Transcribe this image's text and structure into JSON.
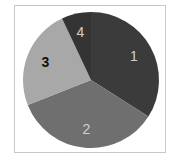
{
  "chart_data": {
    "type": "pie",
    "title": "",
    "categories": [
      "1",
      "2",
      "3",
      "4"
    ],
    "values": [
      34,
      35,
      24,
      7
    ],
    "start_angle_deg_clockwise_from_top": 0,
    "colors": [
      "#3b3b3b",
      "#6f6f6f",
      "#a8a8a8",
      "#343434"
    ],
    "label_colors": [
      "#d0d0d0",
      "#d0d0d0",
      "#111111",
      "#d0d0d0"
    ],
    "legend": "none",
    "labels_inside": true
  }
}
